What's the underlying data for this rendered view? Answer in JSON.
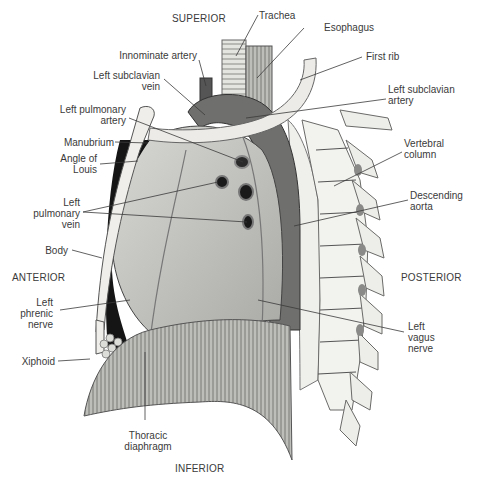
{
  "diagram": {
    "orientation": {
      "superior": "SUPERIOR",
      "inferior": "INFERIOR",
      "anterior": "ANTERIOR",
      "posterior": "POSTERIOR"
    },
    "labels_left": {
      "innominate_artery": "Innominate artery",
      "left_subclavian_vein": "Left subclavian\nvein",
      "left_pulmonary_artery": "Left pulmonary\nartery",
      "manubrium": "Manubrium",
      "angle_of_louis": "Angle of\nLouis",
      "left_pulmonary_vein": "Left\npulmonary\nvein",
      "body": "Body",
      "left_phrenic_nerve": "Left\nphrenic\nnerve",
      "xiphoid": "Xiphoid"
    },
    "labels_right": {
      "trachea": "Trachea",
      "esophagus": "Esophagus",
      "first_rib": "First rib",
      "left_subclavian_artery": "Left subclavian\nartery",
      "vertebral_column": "Vertebral\ncolumn",
      "descending_aorta": "Descending\naorta",
      "left_vagus_nerve": "Left\nvagus\nnerve"
    },
    "labels_bottom": {
      "thoracic_diaphragm": "Thoracic\ndiaphragm"
    },
    "colors": {
      "line": "#3a3a3a",
      "bone": "#ededea",
      "lung": "#c9c9c6",
      "vessel": "#6a6a68",
      "dark": "#1a1a1a",
      "muscle": "#8a8a88"
    }
  }
}
